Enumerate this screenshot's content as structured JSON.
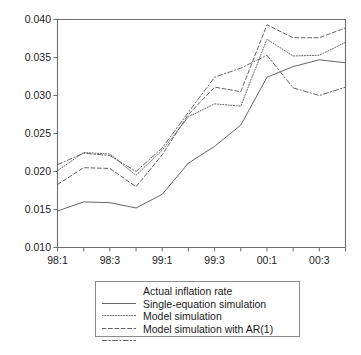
{
  "chart_data": {
    "type": "line",
    "title": "",
    "subtitle": "",
    "xlabel": "",
    "ylabel": "",
    "grid": false,
    "legend_position": "below-plot",
    "x": [
      "98:1",
      "98:2",
      "98:3",
      "98:4",
      "99:1",
      "99:2",
      "99:3",
      "99:4",
      "00:1",
      "00:2",
      "00:3",
      "00:4"
    ],
    "xtick_labels": [
      "98:1",
      "",
      "98:3",
      "",
      "99:1",
      "",
      "99:3",
      "",
      "00:1",
      "",
      "00:3",
      ""
    ],
    "xlim_categories": [
      "98:1",
      "00:4"
    ],
    "ylim": [
      0.01,
      0.04
    ],
    "ytick_labels": [
      "0.010",
      "0.015",
      "0.020",
      "0.025",
      "0.030",
      "0.035",
      "0.040"
    ],
    "ytick_values": [
      0.01,
      0.015,
      0.02,
      0.025,
      0.03,
      0.035,
      0.04
    ],
    "series": [
      {
        "name": "Actual inflation rate",
        "style": "solid",
        "values": [
          0.0148,
          0.016,
          0.0159,
          0.0152,
          0.017,
          0.0211,
          0.0233,
          0.0261,
          0.0324,
          0.0338,
          0.0347,
          0.0343
        ]
      },
      {
        "name": "Single-equation simulation",
        "style": "dotted",
        "values": [
          0.0201,
          0.0225,
          0.0223,
          0.0195,
          0.0228,
          0.0272,
          0.0289,
          0.0286,
          0.0374,
          0.0352,
          0.0353,
          0.037
        ]
      },
      {
        "name": "Model simulation",
        "style": "dashed",
        "values": [
          0.0183,
          0.0205,
          0.0204,
          0.018,
          0.0222,
          0.0275,
          0.0311,
          0.0305,
          0.0393,
          0.0376,
          0.0376,
          0.0389
        ]
      },
      {
        "name": "Model simulation with AR(1)",
        "style": "dashdot",
        "values": [
          0.0209,
          0.0224,
          0.0221,
          0.02,
          0.0231,
          0.0278,
          0.0324,
          0.0336,
          0.0353,
          0.031,
          0.03,
          0.0311
        ]
      }
    ]
  },
  "legend": {
    "items": [
      {
        "label": "Actual inflation rate",
        "style": "solid"
      },
      {
        "label": "Single-equation simulation",
        "style": "dotted"
      },
      {
        "label": "Model simulation",
        "style": "dashed"
      },
      {
        "label": "Model simulation with AR(1)",
        "style": "dashdot"
      }
    ]
  }
}
